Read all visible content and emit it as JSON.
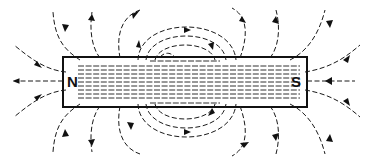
{
  "diagram": {
    "magnet": {
      "north_label": "N",
      "south_label": "S"
    },
    "field_direction": "from N pole to S pole outside the magnet",
    "colors": {
      "line": "#1a1a1a",
      "background": "#ffffff"
    }
  }
}
